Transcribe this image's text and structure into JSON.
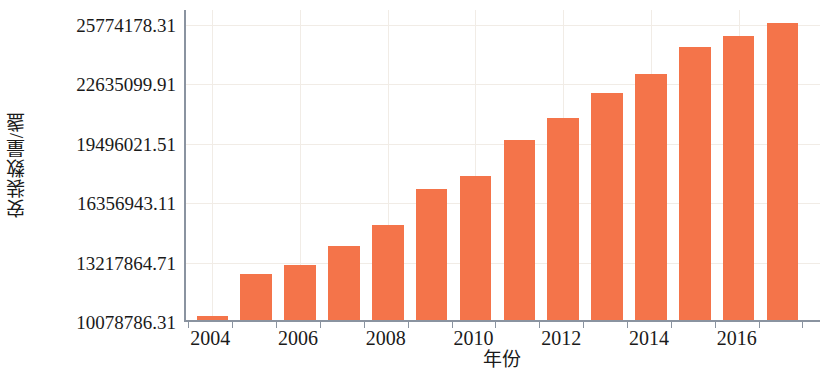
{
  "chart_data": {
    "type": "bar",
    "title": "",
    "xlabel": "年份",
    "ylabel": "安装数量/盏",
    "categories": [
      2004,
      2005,
      2006,
      2007,
      2008,
      2009,
      2010,
      2011,
      2012,
      2013,
      2014,
      2015,
      2016,
      2017
    ],
    "values": [
      10280000,
      12510000,
      12990000,
      14010000,
      15110000,
      17000000,
      17670000,
      19580000,
      20740000,
      22080000,
      23100000,
      24480000,
      25790000,
      10078786.31
    ],
    "series": [
      {
        "name": "安装数量",
        "values": [
          10280000,
          12510000,
          12990000,
          14010000,
          15110000,
          17000000,
          17670000,
          19580000,
          20740000,
          22080000,
          23100000,
          24480000,
          25790000,
          25790000
        ]
      }
    ],
    "ytick_values": [
      10078786.31,
      13217864.71,
      16356943.11,
      19496021.51,
      22635099.91,
      25774178.31
    ],
    "ytick_labels": [
      "10078786.31",
      "13217864.71",
      "16356943.11",
      "19496021.51",
      "22635099.91",
      "25774178.31"
    ],
    "xtick_labels": [
      "2004",
      "2006",
      "2008",
      "2010",
      "2012",
      "2014",
      "2016"
    ],
    "xtick_values": [
      2004,
      2006,
      2008,
      2010,
      2012,
      2014,
      2016
    ],
    "ylim": [
      10078786.31,
      26560000
    ],
    "xlim": [
      2003.4,
      2017.9
    ],
    "grid": true,
    "legend": "none",
    "bar_color": "#f4744a",
    "axis_color": "#8a93a0",
    "grid_color": "#f1ece6",
    "bars": [
      {
        "year": "2004",
        "value": 10280000
      },
      {
        "year": "2005",
        "value": 12510000
      },
      {
        "year": "2006",
        "value": 12990000
      },
      {
        "year": "2007",
        "value": 14010000
      },
      {
        "year": "2008",
        "value": 15110000
      },
      {
        "year": "2009",
        "value": 17000000
      },
      {
        "year": "2010",
        "value": 17670000
      },
      {
        "year": "2011",
        "value": 19580000
      },
      {
        "year": "2012",
        "value": 20740000
      },
      {
        "year": "2013",
        "value": 22080000
      },
      {
        "year": "2014",
        "value": 23100000
      },
      {
        "year": "2015",
        "value": 24480000
      },
      {
        "year": "2016",
        "value": 25090000
      },
      {
        "year": "2017",
        "value": 25790000
      }
    ]
  }
}
